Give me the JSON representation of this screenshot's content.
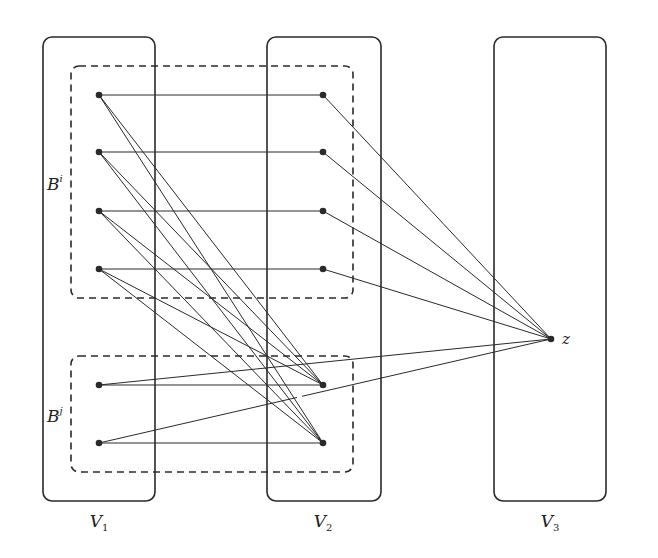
{
  "colors": {
    "stroke": "#2a2a2a",
    "background": "#ffffff",
    "gap": "#ffffff"
  },
  "partitions": [
    {
      "id": "V1",
      "label": "V",
      "sub": "1",
      "x": 43,
      "y": 37,
      "w": 112,
      "h": 464,
      "label_x": 99,
      "label_y": 527
    },
    {
      "id": "V2",
      "label": "V",
      "sub": "2",
      "x": 267,
      "y": 37,
      "w": 114,
      "h": 464,
      "label_x": 323,
      "label_y": 527
    },
    {
      "id": "V3",
      "label": "V",
      "sub": "3",
      "x": 494,
      "y": 37,
      "w": 112,
      "h": 464,
      "label_x": 550,
      "label_y": 527
    }
  ],
  "blocks": [
    {
      "id": "Bi",
      "label": "B",
      "sup": "i",
      "x": 71,
      "y": 66,
      "w": 282,
      "h": 232,
      "label_x": 47,
      "label_y": 190
    },
    {
      "id": "Bj",
      "label": "B",
      "sup": "j",
      "x": 71,
      "y": 356,
      "w": 282,
      "h": 116,
      "label_x": 47,
      "label_y": 422
    }
  ],
  "nodes": [
    {
      "id": "a1",
      "x": 99,
      "y": 95
    },
    {
      "id": "a2",
      "x": 99,
      "y": 152
    },
    {
      "id": "a3",
      "x": 99,
      "y": 211
    },
    {
      "id": "a4",
      "x": 99,
      "y": 269
    },
    {
      "id": "a5",
      "x": 99,
      "y": 385
    },
    {
      "id": "a6",
      "x": 99,
      "y": 443
    },
    {
      "id": "b1",
      "x": 323,
      "y": 95
    },
    {
      "id": "b2",
      "x": 323,
      "y": 152
    },
    {
      "id": "b3",
      "x": 323,
      "y": 211
    },
    {
      "id": "b4",
      "x": 323,
      "y": 269
    },
    {
      "id": "b5",
      "x": 323,
      "y": 385
    },
    {
      "id": "b6",
      "x": 323,
      "y": 443
    },
    {
      "id": "z",
      "x": 551,
      "y": 339,
      "label": "z",
      "label_x": 562,
      "label_y": 344
    }
  ],
  "edges": [
    [
      "a1",
      "b1"
    ],
    [
      "a2",
      "b2"
    ],
    [
      "a3",
      "b3"
    ],
    [
      "a4",
      "b4"
    ],
    [
      "a5",
      "b5"
    ],
    [
      "a6",
      "b6"
    ],
    [
      "a1",
      "b5"
    ],
    [
      "a1",
      "b6"
    ],
    [
      "a2",
      "b5"
    ],
    [
      "a2",
      "b6"
    ],
    [
      "a3",
      "b5"
    ],
    [
      "a3",
      "b6"
    ],
    [
      "a4",
      "b5"
    ],
    [
      "a4",
      "b6"
    ],
    [
      "b1",
      "z"
    ],
    [
      "b2",
      "z"
    ],
    [
      "b3",
      "z"
    ],
    [
      "b4",
      "z"
    ],
    [
      "a5",
      "z"
    ],
    [
      "a6",
      "z"
    ]
  ],
  "gaps": [
    {
      "edge": [
        "a6",
        "z"
      ],
      "t_start": 0.438,
      "t_end": 0.449
    }
  ]
}
